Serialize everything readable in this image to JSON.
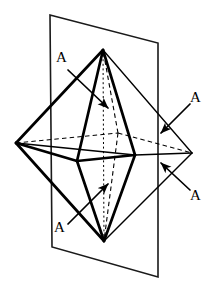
{
  "figure": {
    "background_color": "#ffffff",
    "stroke_color": "#000000",
    "width": 217,
    "height": 291,
    "plane": {
      "name": "mirror-plane",
      "stroke_color": "#1a1a1a",
      "stroke_width": 1.6,
      "corners": [
        {
          "x": 50,
          "y": 15
        },
        {
          "x": 158,
          "y": 43
        },
        {
          "x": 158,
          "y": 277
        },
        {
          "x": 52,
          "y": 247
        }
      ]
    },
    "solid": {
      "name": "octahedron",
      "stroke_width_solid": 2.6,
      "stroke_width_thin": 1.5,
      "stroke_width_dashed": 1.1,
      "vertices": {
        "top": {
          "x": 103,
          "y": 50
        },
        "bottom": {
          "x": 104,
          "y": 241
        },
        "left": {
          "x": 16,
          "y": 143
        },
        "right": {
          "x": 192,
          "y": 153
        },
        "front_left": {
          "x": 77,
          "y": 161
        },
        "front_right": {
          "x": 135,
          "y": 155
        },
        "back": {
          "x": 118,
          "y": 133
        }
      }
    },
    "labels": [
      {
        "id": "label-a-top-left",
        "text": "A",
        "x": 56,
        "y": 50,
        "arrow": {
          "from": {
            "x": 68,
            "y": 70
          },
          "to": {
            "x": 108,
            "y": 108
          }
        }
      },
      {
        "id": "label-a-right-upper",
        "text": "A",
        "x": 190,
        "y": 90,
        "arrow": {
          "from": {
            "x": 190,
            "y": 104
          },
          "to": {
            "x": 161,
            "y": 133
          }
        }
      },
      {
        "id": "label-a-right-lower",
        "text": "A",
        "x": 190,
        "y": 188,
        "arrow": {
          "from": {
            "x": 190,
            "y": 190
          },
          "to": {
            "x": 161,
            "y": 163
          }
        }
      },
      {
        "id": "label-a-bottom-left",
        "text": "A",
        "x": 54,
        "y": 220,
        "arrow": {
          "from": {
            "x": 68,
            "y": 224
          },
          "to": {
            "x": 108,
            "y": 184
          }
        }
      }
    ]
  }
}
